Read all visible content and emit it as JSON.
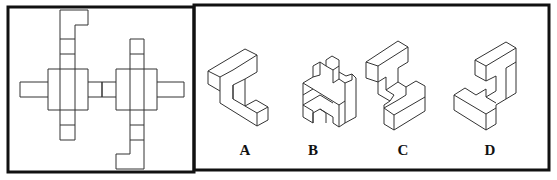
{
  "puzzle": {
    "question_panel": {
      "content": "cube-net"
    },
    "options": [
      {
        "label": "A"
      },
      {
        "label": "B"
      },
      {
        "label": "C"
      },
      {
        "label": "D"
      }
    ]
  }
}
